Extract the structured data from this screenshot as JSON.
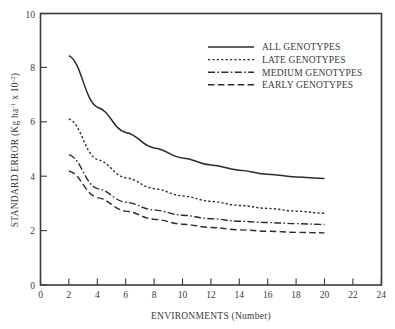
{
  "chart_data": {
    "type": "line",
    "title": "",
    "xlabel": "ENVIRONMENTS (Number)",
    "ylabel": "STANDARD ERROR (Kg ha",
    "ylabel_sup1": "-1",
    "ylabel_mid": " x 10",
    "ylabel_sup2": "-2",
    "ylabel_end": ")",
    "xlim": [
      0,
      24
    ],
    "ylim": [
      0,
      10
    ],
    "xticks": [
      0,
      2,
      4,
      6,
      8,
      10,
      12,
      14,
      16,
      18,
      20,
      22,
      24
    ],
    "yticks": [
      0,
      2,
      4,
      6,
      8,
      10
    ],
    "xtick_labels": [
      "0",
      "2",
      "4",
      "6",
      "8",
      "10",
      "12",
      "14",
      "16",
      "18",
      "20",
      "22",
      "24"
    ],
    "ytick_labels": [
      "0",
      "2",
      "4",
      "6",
      "8",
      "10"
    ],
    "grid": false,
    "legend_position": "upper-right-inside",
    "x": [
      2,
      4,
      6,
      8,
      10,
      12,
      14,
      16,
      18,
      20
    ],
    "series": [
      {
        "name": "ALL GENOTYPES",
        "style": "solid",
        "color": "#2b2b2b",
        "values": [
          8.45,
          6.55,
          5.62,
          5.05,
          4.68,
          4.42,
          4.23,
          4.08,
          3.98,
          3.92
        ]
      },
      {
        "name": "LATE GENOTYPES",
        "style": "dotted",
        "color": "#2b2b2b",
        "values": [
          6.12,
          4.62,
          3.95,
          3.55,
          3.28,
          3.08,
          2.93,
          2.82,
          2.72,
          2.64
        ]
      },
      {
        "name": "MEDIUM GENOTYPES",
        "style": "dashdot",
        "color": "#2b2b2b",
        "values": [
          4.8,
          3.55,
          3.05,
          2.76,
          2.57,
          2.44,
          2.35,
          2.3,
          2.26,
          2.23
        ]
      },
      {
        "name": "EARLY GENOTYPES",
        "style": "dashed",
        "color": "#2b2b2b",
        "values": [
          4.2,
          3.22,
          2.72,
          2.42,
          2.24,
          2.12,
          2.03,
          1.98,
          1.94,
          1.92
        ]
      }
    ]
  },
  "legend": {
    "items": [
      {
        "label": "ALL GENOTYPES",
        "style": "solid"
      },
      {
        "label": "LATE GENOTYPES",
        "style": "dotted"
      },
      {
        "label": "MEDIUM GENOTYPES",
        "style": "dashdot"
      },
      {
        "label": "EARLY GENOTYPES",
        "style": "dashed"
      }
    ]
  },
  "axes": {
    "frame_color": "#3a3a3a",
    "x_title": "ENVIRONMENTS (Number)"
  }
}
